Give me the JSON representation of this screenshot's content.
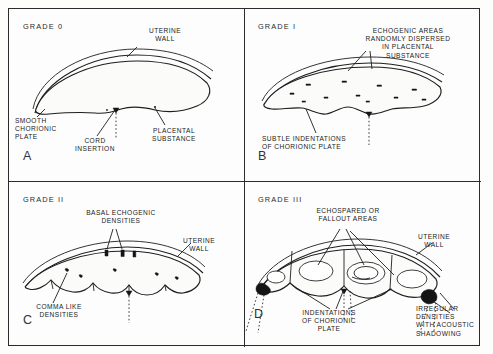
{
  "figure": {
    "type": "medical-illustration",
    "panel_count": 4
  },
  "panels": [
    {
      "id": "A",
      "letter": "A",
      "grade_label": "GRADE  0",
      "labels": [
        {
          "key": "uterine_wall",
          "text": [
            "UTERINE",
            "WALL"
          ]
        },
        {
          "key": "smooth_chorionic_plate",
          "text": [
            "SMOOTH",
            "CHORIONIC",
            "PLATE"
          ]
        },
        {
          "key": "cord_insertion",
          "text": [
            "CORD",
            "INSERTION"
          ]
        },
        {
          "key": "placental_substance",
          "text": [
            "PLACENTAL",
            "SUBSTANCE"
          ]
        }
      ]
    },
    {
      "id": "B",
      "letter": "B",
      "grade_label": "GRADE  I",
      "labels": [
        {
          "key": "echogenic_areas",
          "text": [
            "ECHOGENIC AREAS",
            "RANDOMLY DISPERSED",
            "IN PLACENTAL",
            "SUBSTANCE"
          ]
        },
        {
          "key": "subtle_indentations",
          "text": [
            "SUBTLE INDENTATIONS",
            "OF CHORIONIC PLATE"
          ]
        }
      ]
    },
    {
      "id": "C",
      "letter": "C",
      "grade_label": "GRADE  II",
      "labels": [
        {
          "key": "basal_echogenic_densities",
          "text": [
            "BASAL ECHOGENIC",
            "DENSITIES"
          ]
        },
        {
          "key": "uterine_wall",
          "text": [
            "UTERINE",
            "WALL"
          ]
        },
        {
          "key": "comma_like_densities",
          "text": [
            "COMMA LIKE",
            "DENSITIES"
          ]
        }
      ]
    },
    {
      "id": "D",
      "letter": "D",
      "grade_label": "GRADE  III",
      "labels": [
        {
          "key": "echospared_fallout",
          "text": [
            "ECHOSPARED OR",
            "FALLOUT AREAS"
          ]
        },
        {
          "key": "uterine_wall",
          "text": [
            "UTERINE",
            "WALL"
          ]
        },
        {
          "key": "indentations_chorionic_plate",
          "text": [
            "INDENTATIONS",
            "OF CHORIONIC",
            "PLATE"
          ]
        },
        {
          "key": "irregular_densities",
          "text": [
            "IRREGULAR",
            "DENSITIES",
            "WITH ACOUSTIC",
            "SHADOWING"
          ]
        }
      ]
    }
  ],
  "colors": {
    "ink": "#1e1e1e",
    "paper": "#fdfdfd",
    "dense_echo": "#151515",
    "echospared": "#ffffff"
  }
}
